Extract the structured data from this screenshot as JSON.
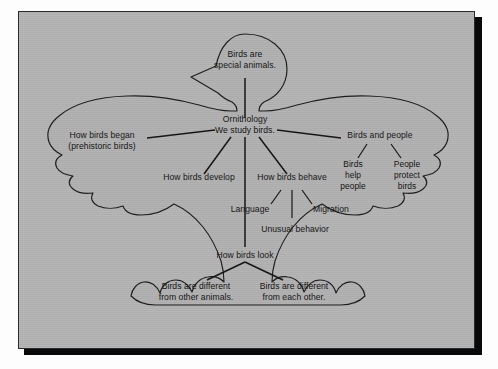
{
  "figure": {
    "kind": "concept-map",
    "shape": "bird-silhouette",
    "panel_color": "#b0b0b0",
    "outline_color": "#1b1b1b",
    "text_color": "#101010",
    "frame_border_color": "#2b2b2b",
    "shadow_color": "#07090a",
    "page_background": "#fdfdfd"
  },
  "nodes": {
    "head": {
      "id": "head",
      "line1": "Birds are",
      "line2": "special animals."
    },
    "center": {
      "id": "center",
      "line1": "Ornithology",
      "line2": "We study birds."
    },
    "began": {
      "id": "how-birds-began",
      "line1": "How birds began",
      "line2": "(prehistoric birds)"
    },
    "develop": {
      "id": "how-birds-develop",
      "line1": "How birds develop"
    },
    "behave": {
      "id": "how-birds-behave",
      "line1": "How birds behave"
    },
    "language": {
      "id": "language",
      "line1": "Language"
    },
    "migration": {
      "id": "migration",
      "line1": "Migration"
    },
    "unusual": {
      "id": "unusual-behavior",
      "line1": "Unusual behavior"
    },
    "people": {
      "id": "birds-and-people",
      "line1": "Birds and people"
    },
    "birds_help": {
      "id": "birds-help-people",
      "line1": "Birds",
      "line2": "help",
      "line3": "people"
    },
    "people_protect": {
      "id": "people-protect-birds",
      "line1": "People",
      "line2": "protect",
      "line3": "birds"
    },
    "look": {
      "id": "how-birds-look",
      "line1": "How birds look"
    },
    "diff_animals": {
      "id": "birds-different-from-other-animals",
      "line1": "Birds are different",
      "line2": "from other animals."
    },
    "diff_each": {
      "id": "birds-different-from-each-other",
      "line1": "Birds are different",
      "line2": "from each other."
    }
  }
}
